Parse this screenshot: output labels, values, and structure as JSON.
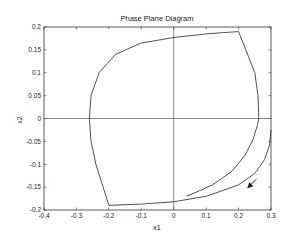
{
  "chart_data": {
    "type": "line",
    "title": "Phase Plane Diagram",
    "xlabel": "x1",
    "ylabel": "x2",
    "xlim": [
      -0.4,
      0.3
    ],
    "ylim": [
      -0.2,
      0.2
    ],
    "xticks": [
      "-0.4",
      "-0.3",
      "-0.2",
      "-0.1",
      "0",
      "0.1",
      "0.2",
      "0.3"
    ],
    "yticks": [
      "0.2",
      "0.15",
      "0.1",
      "0.05",
      "0",
      "-0.05",
      "-0.1",
      "-0.15",
      "-0.2"
    ],
    "grid": false,
    "axes_lines": {
      "x2_zero": true,
      "x1_zero": true
    },
    "series": [
      {
        "name": "trajectory",
        "x": [
          0.04,
          0.12,
          0.18,
          0.22,
          0.245,
          0.258,
          0.262,
          0.26,
          0.25,
          0.2,
          0.1,
          0.0,
          -0.1,
          -0.18,
          -0.23,
          -0.255,
          -0.26,
          -0.255,
          -0.24,
          -0.2,
          -0.1,
          0.0,
          0.1,
          0.2,
          0.25,
          0.28,
          0.295,
          0.3
        ],
        "y": [
          -0.17,
          -0.145,
          -0.115,
          -0.08,
          -0.045,
          -0.015,
          0.0,
          0.05,
          0.1,
          0.19,
          0.185,
          0.177,
          0.165,
          0.14,
          0.1,
          0.05,
          0.0,
          -0.05,
          -0.1,
          -0.19,
          -0.187,
          -0.182,
          -0.17,
          -0.145,
          -0.12,
          -0.09,
          -0.06,
          -0.025
        ]
      }
    ],
    "annotations": [
      {
        "type": "arrow",
        "x": 0.23,
        "y": -0.15,
        "direction": "down-left"
      }
    ]
  }
}
